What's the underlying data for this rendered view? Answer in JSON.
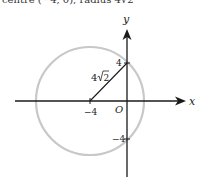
{
  "caption": "centre (−4, 0), radius 4√2",
  "axes": {
    "x_label": "x",
    "y_label": "y",
    "origin_label": "O"
  },
  "circle": {
    "center_label": "−4",
    "y_intercept_top_label": "4",
    "y_intercept_bottom_label": "−4",
    "radius_label_coef": "4",
    "radius_label_root": "2",
    "stroke_color": "#c8c8c8"
  },
  "colors": {
    "axis": "#1a1a1a",
    "radius_line": "#1a1a1a"
  }
}
